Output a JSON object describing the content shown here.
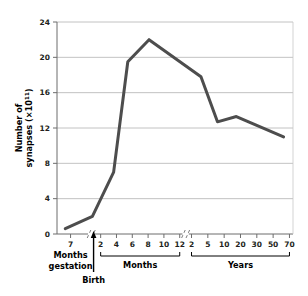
{
  "chart_data": {
    "type": "line",
    "title": "",
    "subtitle": "",
    "xlabel": "",
    "ylabel": "Number of synapses (×10¹¹)",
    "ylabel_line1": "Number of",
    "ylabel_line2_prefix": "synapses (×10",
    "ylabel_line2_sup": "11",
    "ylabel_line2_suffix": ")",
    "ylim": [
      0,
      24
    ],
    "yticks": [
      0,
      4,
      8,
      12,
      16,
      20,
      24
    ],
    "ytick_labels": [
      "0",
      "4",
      "8",
      "12",
      "16",
      "20",
      "24"
    ],
    "grid": true,
    "grid_axis": "y",
    "legend": false,
    "axis_breaks": 2,
    "line_color": "#4d4d4d",
    "grid_color": "#b3b3b3",
    "axis_color": "#6d6d6d",
    "x_segments": [
      {
        "name": "gestation",
        "group_label": "Months gestation",
        "group_label_line1": "Months",
        "group_label_line2": "gestation",
        "bracket": false,
        "ticks": [
          "7"
        ],
        "tick_values": [
          7
        ]
      },
      {
        "name": "months",
        "group_label": "Months",
        "bracket": true,
        "ticks": [
          "2",
          "4",
          "6",
          "8",
          "10",
          "12"
        ],
        "tick_values": [
          2,
          4,
          6,
          8,
          10,
          12
        ]
      },
      {
        "name": "years",
        "group_label": "Years",
        "bracket": true,
        "ticks": [
          "2",
          "5",
          "10",
          "20",
          "30",
          "50",
          "70"
        ],
        "tick_values": [
          2,
          5,
          10,
          20,
          30,
          50,
          70
        ]
      }
    ],
    "annotations": [
      {
        "name": "birth-marker",
        "label": "Birth",
        "type": "arrow-up",
        "x_position": 0.155
      }
    ],
    "points": [
      {
        "label": "7 months gestation",
        "x": 0.035,
        "y": 0.6
      },
      {
        "label": "birth",
        "x": 0.15,
        "y": 2.0
      },
      {
        "label": "2 months",
        "x": 0.24,
        "y": 7.0
      },
      {
        "label": "4 months",
        "x": 0.3,
        "y": 19.5
      },
      {
        "label": "8 months",
        "x": 0.39,
        "y": 22.0
      },
      {
        "label": "2 years",
        "x": 0.61,
        "y": 17.8
      },
      {
        "label": "10 years",
        "x": 0.68,
        "y": 12.7
      },
      {
        "label": "25 years",
        "x": 0.76,
        "y": 13.3
      },
      {
        "label": "70 years",
        "x": 0.96,
        "y": 11.0
      }
    ],
    "x": [
      0.035,
      0.15,
      0.24,
      0.3,
      0.39,
      0.61,
      0.68,
      0.76,
      0.96
    ],
    "values": [
      0.6,
      2.0,
      7.0,
      19.5,
      22.0,
      17.8,
      12.7,
      13.3,
      11.0
    ]
  }
}
